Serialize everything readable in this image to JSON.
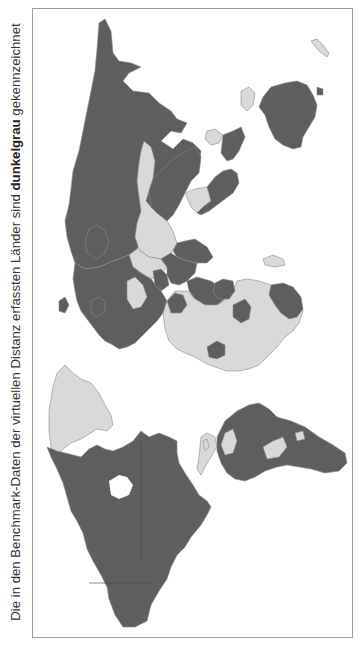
{
  "caption": {
    "prefix": "Die in den Benchmark-Daten der virtuellen Distanz erfassten Länder sind ",
    "bold": "dunkelgrau",
    "suffix": " gekennzeichnet"
  },
  "map": {
    "orientation": "world map rotated 90° counter-clockwise (north to the left)",
    "legend": {
      "included_color": "#5e5e5e",
      "excluded_color": "#d9d9d9",
      "border_color": "#8a8a8a",
      "ocean_color": "#ffffff"
    },
    "regions_included": [
      "Russia",
      "Kazakhstan",
      "Mongolia (border)",
      "Japan",
      "South Korea",
      "India",
      "Pakistan",
      "Thailand",
      "Malaysia",
      "Indonesia",
      "Philippines",
      "Australia",
      "Europe",
      "Turkey",
      "Iran",
      "Saudi Arabia",
      "Egypt",
      "Nigeria",
      "Kenya",
      "South Africa",
      "Canada",
      "United States",
      "Mexico",
      "Brazil",
      "Argentina",
      "Chile",
      "Colombia",
      "Peru"
    ],
    "regions_excluded": [
      "China",
      "Central Asia (parts)",
      "Most of Africa",
      "Greenland",
      "Bolivia",
      "Paraguay",
      "Venezuela",
      "Guyana/Suriname",
      "Central America (parts)",
      "Papua New Guinea",
      "New Zealand (light)"
    ]
  }
}
